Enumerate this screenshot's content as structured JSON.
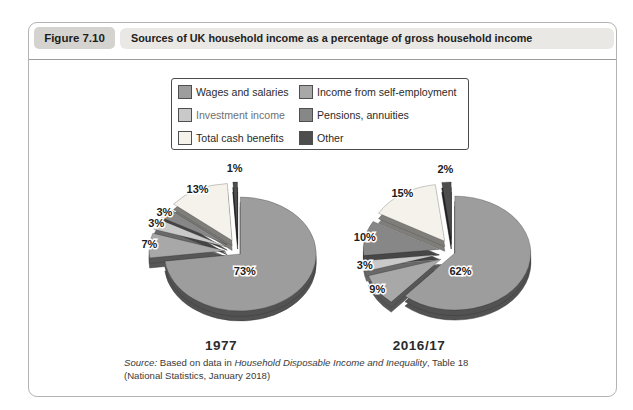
{
  "figure": {
    "label": "Figure 7.10",
    "title": "Sources of UK household income as a percentage of gross household income"
  },
  "legend": {
    "items": [
      {
        "label": "Wages and salaries",
        "color": "#9d9d9d",
        "faded": false
      },
      {
        "label": "Income from self-employment",
        "color": "#a8a8a8",
        "faded": false
      },
      {
        "label": "Investment income",
        "color": "#c9c9c9",
        "faded": true
      },
      {
        "label": "Pensions, annuities",
        "color": "#878787",
        "faded": false
      },
      {
        "label": "Total cash benefits",
        "color": "#f4f2ea",
        "faded": false
      },
      {
        "label": "Other",
        "color": "#4d4d4d",
        "faded": false
      }
    ]
  },
  "chart_data": [
    {
      "type": "pie",
      "title": "1977",
      "style": "3d-exploded",
      "unit": "% of gross household income",
      "slices": [
        {
          "label": "Wages and salaries",
          "value": 73
        },
        {
          "label": "Income from self-employment",
          "value": 7
        },
        {
          "label": "Investment income",
          "value": 3
        },
        {
          "label": "Pensions, annuities",
          "value": 3
        },
        {
          "label": "Total cash benefits",
          "value": 13
        },
        {
          "label": "Other",
          "value": 1
        }
      ]
    },
    {
      "type": "pie",
      "title": "2016/17",
      "style": "3d-exploded",
      "unit": "% of gross household income",
      "slices": [
        {
          "label": "Wages and salaries",
          "value": 62
        },
        {
          "label": "Income from self-employment",
          "value": 9
        },
        {
          "label": "Investment income",
          "value": 3
        },
        {
          "label": "Pensions, annuities",
          "value": 10
        },
        {
          "label": "Total cash benefits",
          "value": 15
        },
        {
          "label": "Other",
          "value": 2
        }
      ]
    }
  ],
  "source": {
    "prefix": "Source:",
    "before": " Based on data in ",
    "work": "Household Disposable Income and Inequality",
    "after": ", Table 18",
    "line2": "(National Statistics, January 2018)"
  }
}
